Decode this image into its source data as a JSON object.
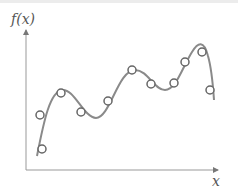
{
  "diagram": {
    "y_label": "f(x)",
    "x_label": "x",
    "colors": {
      "axis": "#888888",
      "curve": "#8a8a8a",
      "marker_stroke": "#666666",
      "marker_fill": "#ffffff",
      "label": "#555555"
    }
  },
  "chart_data": {
    "type": "scatter",
    "title": "",
    "xlabel": "x",
    "ylabel": "f(x)",
    "grid": false,
    "legend": null,
    "points_px": [
      {
        "x": 42,
        "y": 149
      },
      {
        "x": 40,
        "y": 115
      },
      {
        "x": 61,
        "y": 93
      },
      {
        "x": 81,
        "y": 112
      },
      {
        "x": 108,
        "y": 101
      },
      {
        "x": 132,
        "y": 70
      },
      {
        "x": 151,
        "y": 84
      },
      {
        "x": 174,
        "y": 83
      },
      {
        "x": 185,
        "y": 62
      },
      {
        "x": 202,
        "y": 52
      },
      {
        "x": 210,
        "y": 90
      }
    ],
    "curve_path": "M37,156 C44,120 50,92 62,90 C74,88 84,118 96,118 C110,118 118,70 135,70 C148,70 154,90 165,90 C176,90 182,68 192,52 C198,42 204,40 208,56 C212,70 213,86 214,100"
  }
}
